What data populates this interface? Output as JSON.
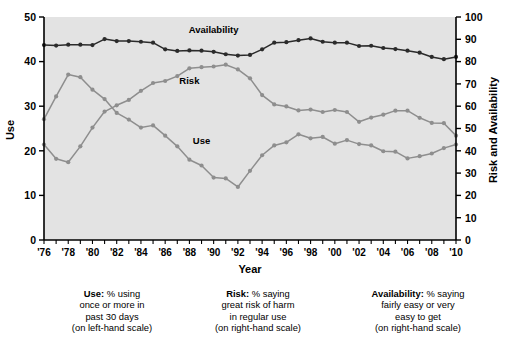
{
  "chart_data": {
    "type": "line",
    "title": "",
    "xlabel": "Year",
    "ylabel": "Use",
    "y2label": "Risk and Availability",
    "ylim": [
      0,
      50
    ],
    "y2lim": [
      0,
      100
    ],
    "grid": false,
    "legend_position": "inline-annotations",
    "x": [
      1976,
      1977,
      1978,
      1979,
      1980,
      1981,
      1982,
      1983,
      1984,
      1985,
      1986,
      1987,
      1988,
      1989,
      1990,
      1991,
      1992,
      1993,
      1994,
      1995,
      1996,
      1997,
      1998,
      1999,
      2000,
      2001,
      2002,
      2003,
      2004,
      2005,
      2006,
      2007,
      2008,
      2009,
      2010
    ],
    "xtick_labels": [
      "'76",
      "'78",
      "'80",
      "'82",
      "'84",
      "'86",
      "'88",
      "'90",
      "'92",
      "'94",
      "'96",
      "'98",
      "'00",
      "'02",
      "'04",
      "'06",
      "'08",
      "'10"
    ],
    "xtick_years": [
      1976,
      1978,
      1980,
      1982,
      1984,
      1986,
      1988,
      1990,
      1992,
      1994,
      1996,
      1998,
      2000,
      2002,
      2004,
      2006,
      2008,
      2010
    ],
    "ytick_labels": [
      "0",
      "10",
      "20",
      "30",
      "40",
      "50"
    ],
    "ytick_values": [
      0,
      10,
      20,
      30,
      40,
      50
    ],
    "y2tick_labels": [
      "0",
      "10",
      "20",
      "30",
      "40",
      "50",
      "60",
      "70",
      "80",
      "90",
      "100"
    ],
    "y2tick_values": [
      0,
      10,
      20,
      30,
      40,
      50,
      60,
      70,
      80,
      90,
      100
    ],
    "series": [
      {
        "name": "Availability",
        "axis": "right",
        "color": "#2b2b2b",
        "label_x": 1990,
        "label_y": 93,
        "values": [
          87.4,
          87.2,
          87.6,
          87.6,
          87.4,
          90.1,
          89.2,
          89.2,
          88.9,
          88.5,
          85.5,
          84.8,
          85.0,
          84.9,
          84.4,
          83.3,
          82.7,
          83.0,
          85.5,
          88.5,
          88.7,
          89.6,
          90.4,
          88.9,
          88.5,
          88.5,
          87.0,
          87.1,
          86.1,
          85.6,
          84.9,
          84.0,
          82.1,
          81.1,
          82.1
        ]
      },
      {
        "name": "Risk",
        "axis": "right",
        "color": "#8e8e8e",
        "label_x": 1988,
        "label_y": 70,
        "values": [
          42.8,
          36.4,
          34.9,
          42.0,
          50.4,
          57.6,
          60.4,
          62.8,
          66.9,
          70.4,
          71.3,
          73.5,
          77.0,
          77.5,
          77.8,
          78.6,
          76.5,
          72.5,
          65.0,
          60.8,
          59.9,
          58.1,
          58.5,
          57.4,
          58.3,
          57.4,
          53.0,
          54.9,
          56.2,
          58.0,
          58.0,
          54.8,
          52.5,
          52.4,
          46.8
        ]
      },
      {
        "name": "Use",
        "axis": "left",
        "color": "#8e8e8e",
        "label_x": 1989,
        "label_y": 21.5,
        "values": [
          27.1,
          32.2,
          37.1,
          36.5,
          33.7,
          31.6,
          28.5,
          27.0,
          25.2,
          25.7,
          23.4,
          21.0,
          18.0,
          16.7,
          14.0,
          13.8,
          11.9,
          15.5,
          19.0,
          21.2,
          21.9,
          23.7,
          22.8,
          23.1,
          21.6,
          22.4,
          21.5,
          21.2,
          19.9,
          19.8,
          18.3,
          18.8,
          19.4,
          20.6,
          21.4
        ]
      }
    ]
  },
  "notes": {
    "use": {
      "bold": "Use:",
      "lines": [
        "% using",
        "once or more in",
        "past 30 days",
        "(on left-hand scale)"
      ]
    },
    "risk": {
      "bold": "Risk:",
      "lines": [
        "% saying",
        "great risk of harm",
        "in regular use",
        "(on right-hand scale)"
      ]
    },
    "availability": {
      "bold": "Availability:",
      "lines": [
        "% saying",
        "fairly easy or very",
        "easy to get",
        "(on right-hand scale)"
      ]
    }
  },
  "colors": {
    "plot_background": "#e3e3e3",
    "page_background": "#ffffff",
    "axis": "#000000",
    "availability": "#2b2b2b",
    "risk": "#8e8e8e",
    "use": "#8e8e8e"
  }
}
